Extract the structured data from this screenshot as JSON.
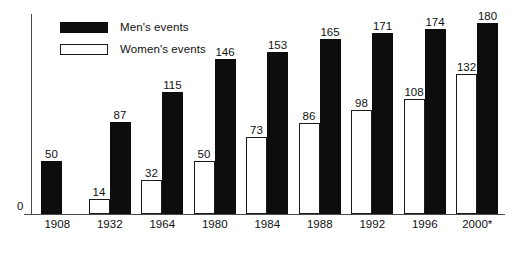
{
  "chart_data": {
    "type": "bar",
    "title": "",
    "subtitle": "",
    "xlabel": "",
    "ylabel": "",
    "ylim": [
      0,
      190
    ],
    "grid": false,
    "legend_position": "top-left",
    "categories": [
      "1908",
      "1932",
      "1964",
      "1980",
      "1984",
      "1988",
      "1992",
      "1996",
      "2000*"
    ],
    "axis": {
      "y_ticks": [
        "0"
      ],
      "zero_label": "0"
    },
    "series": [
      {
        "name": "Women's events",
        "color": "#ffffff",
        "style": "outline",
        "values": [
          null,
          14,
          32,
          50,
          73,
          86,
          98,
          108,
          132
        ]
      },
      {
        "name": "Men's events",
        "color": "#0d0d0d",
        "style": "filled",
        "values": [
          50,
          87,
          115,
          146,
          153,
          165,
          171,
          174,
          180
        ]
      }
    ],
    "annotations": [
      "* indicates projected or provisional figure for 2000"
    ]
  },
  "legend": {
    "items": [
      {
        "label": "Men's events",
        "swatch": "filled-black"
      },
      {
        "label": "Women's events",
        "swatch": "outline-white"
      }
    ]
  },
  "colors": {
    "men_bar": "#0d0d0d",
    "women_bar": "#ffffff",
    "women_bar_border": "#1a1a1a",
    "axis": "#4a4a4a",
    "text": "#111111",
    "background": "#ffffff"
  }
}
